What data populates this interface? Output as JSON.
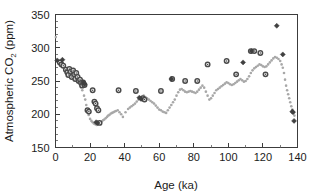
{
  "chart_data": {
    "type": "scatter",
    "title": "",
    "xlabel": "Age (ka)",
    "ylabel_main": "Atmospheric CO",
    "ylabel_sub": "2",
    "ylabel_unit": " (ppm)",
    "ylabel_full": "Atmospheric CO2 (ppm)",
    "xlim": [
      0,
      140
    ],
    "ylim": [
      150,
      350
    ],
    "xticks": [
      0,
      20,
      40,
      60,
      80,
      100,
      120,
      140
    ],
    "xtick_labels": [
      "0",
      "20",
      "40",
      "60",
      "80",
      "100",
      "120",
      "140"
    ],
    "x_minor_step": 10,
    "yticks": [
      150,
      200,
      250,
      300,
      350
    ],
    "ytick_labels": [
      "150",
      "200",
      "250",
      "300",
      "350"
    ],
    "y_minor_step": 10,
    "grid": false,
    "legend": "none",
    "frame": "box",
    "colors": {
      "dot_series": "#a8a8a8",
      "circle_series": "#4a4a4a",
      "diamond_series": "#404040",
      "axis": "#3c3c3c",
      "text": "#1c1c1c",
      "background": "#ffffff"
    },
    "series": [
      {
        "name": "ice-core-record-dots",
        "marker": "dot",
        "color": "#a8a8a8",
        "size": 2.6,
        "points": [
          [
            0.2,
            316
          ],
          [
            1.5,
            280
          ],
          [
            3.0,
            277
          ],
          [
            5.0,
            272
          ],
          [
            7.5,
            268
          ],
          [
            9.0,
            264
          ],
          [
            10.5,
            262
          ],
          [
            12.0,
            258
          ],
          [
            13.5,
            250
          ],
          [
            14.5,
            243
          ],
          [
            15.5,
            236
          ],
          [
            16.5,
            228
          ],
          [
            17.2,
            222
          ],
          [
            17.8,
            214
          ],
          [
            18.5,
            206
          ],
          [
            19.2,
            199
          ],
          [
            20.0,
            193
          ],
          [
            20.8,
            190
          ],
          [
            21.5,
            188
          ],
          [
            22.2,
            186
          ],
          [
            23.0,
            185
          ],
          [
            23.8,
            184
          ],
          [
            24.5,
            185
          ],
          [
            25.2,
            186
          ],
          [
            26.0,
            188
          ],
          [
            26.8,
            189
          ],
          [
            27.5,
            191
          ],
          [
            28.2,
            192
          ],
          [
            29.0,
            194
          ],
          [
            29.8,
            196
          ],
          [
            30.5,
            198
          ],
          [
            31.2,
            199
          ],
          [
            32.0,
            201
          ],
          [
            32.8,
            202
          ],
          [
            33.5,
            203
          ],
          [
            34.2,
            204
          ],
          [
            35.0,
            205
          ],
          [
            36.0,
            206
          ],
          [
            37.0,
            203
          ],
          [
            38.0,
            200
          ],
          [
            39.0,
            196
          ],
          [
            40.5,
            203
          ],
          [
            42.0,
            208
          ],
          [
            43.0,
            210
          ],
          [
            44.0,
            212
          ],
          [
            45.0,
            214
          ],
          [
            46.0,
            216
          ],
          [
            47.0,
            219
          ],
          [
            48.0,
            222
          ],
          [
            49.0,
            224
          ],
          [
            50.0,
            226
          ],
          [
            51.0,
            228
          ],
          [
            52.0,
            226
          ],
          [
            53.0,
            224
          ],
          [
            54.0,
            222
          ],
          [
            55.0,
            220
          ],
          [
            56.0,
            218
          ],
          [
            57.0,
            216
          ],
          [
            58.0,
            213
          ],
          [
            59.0,
            210
          ],
          [
            60.0,
            207
          ],
          [
            61.0,
            206
          ],
          [
            62.0,
            204
          ],
          [
            63.0,
            203
          ],
          [
            64.0,
            202
          ],
          [
            65.0,
            206
          ],
          [
            66.0,
            210
          ],
          [
            67.0,
            214
          ],
          [
            68.0,
            218
          ],
          [
            69.0,
            222
          ],
          [
            70.0,
            228
          ],
          [
            71.0,
            233
          ],
          [
            72.0,
            237
          ],
          [
            73.0,
            238
          ],
          [
            74.0,
            236
          ],
          [
            75.0,
            234
          ],
          [
            76.0,
            233
          ],
          [
            77.0,
            234
          ],
          [
            78.0,
            235
          ],
          [
            79.0,
            234
          ],
          [
            80.0,
            233
          ],
          [
            81.0,
            232
          ],
          [
            82.0,
            234
          ],
          [
            83.0,
            237
          ],
          [
            84.0,
            240
          ],
          [
            85.0,
            243
          ],
          [
            86.0,
            240
          ],
          [
            87.0,
            234
          ],
          [
            88.0,
            228
          ],
          [
            89.0,
            222
          ],
          [
            90.0,
            224
          ],
          [
            91.0,
            228
          ],
          [
            92.0,
            232
          ],
          [
            93.0,
            236
          ],
          [
            94.0,
            238
          ],
          [
            95.0,
            240
          ],
          [
            96.0,
            242
          ],
          [
            97.0,
            244
          ],
          [
            98.0,
            246
          ],
          [
            99.0,
            248
          ],
          [
            100.0,
            247
          ],
          [
            101.0,
            245
          ],
          [
            102.0,
            244
          ],
          [
            103.0,
            245
          ],
          [
            104.0,
            247
          ],
          [
            105.0,
            249
          ],
          [
            106.0,
            251
          ],
          [
            107.0,
            253
          ],
          [
            108.0,
            251
          ],
          [
            109.0,
            249
          ],
          [
            110.0,
            250
          ],
          [
            111.0,
            253
          ],
          [
            112.0,
            257
          ],
          [
            113.0,
            262
          ],
          [
            114.0,
            266
          ],
          [
            115.0,
            269
          ],
          [
            116.0,
            271
          ],
          [
            117.0,
            273
          ],
          [
            118.0,
            275
          ],
          [
            119.0,
            274
          ],
          [
            120.0,
            272
          ],
          [
            121.0,
            271
          ],
          [
            122.0,
            272
          ],
          [
            123.0,
            275
          ],
          [
            124.0,
            278
          ],
          [
            125.0,
            281
          ],
          [
            126.0,
            284
          ],
          [
            127.0,
            286
          ],
          [
            128.0,
            285
          ],
          [
            129.0,
            283
          ],
          [
            130.0,
            280
          ],
          [
            130.8,
            275
          ],
          [
            131.5,
            270
          ],
          [
            132.2,
            262
          ],
          [
            132.8,
            252
          ],
          [
            133.4,
            243
          ],
          [
            134.0,
            236
          ],
          [
            134.6,
            230
          ],
          [
            135.2,
            224
          ],
          [
            135.8,
            218
          ],
          [
            136.4,
            212
          ],
          [
            137.0,
            207
          ],
          [
            137.6,
            202
          ],
          [
            138.2,
            198
          ]
        ]
      },
      {
        "name": "vostok-ringed-circles",
        "marker": "ringed-circle",
        "color": "#4a4a4a",
        "size": 4.4,
        "points": [
          [
            2.5,
            278
          ],
          [
            3.5,
            275
          ],
          [
            4.5,
            273
          ],
          [
            6.0,
            267
          ],
          [
            6.8,
            263
          ],
          [
            7.4,
            259
          ],
          [
            8.0,
            268
          ],
          [
            8.8,
            264
          ],
          [
            9.4,
            256
          ],
          [
            10.2,
            266
          ],
          [
            10.8,
            260
          ],
          [
            11.4,
            253
          ],
          [
            12.0,
            262
          ],
          [
            12.8,
            256
          ],
          [
            13.4,
            250
          ],
          [
            14.2,
            252
          ],
          [
            14.8,
            247
          ],
          [
            15.4,
            243
          ],
          [
            16.0,
            248
          ],
          [
            16.8,
            244
          ],
          [
            18.5,
            206
          ],
          [
            19.3,
            204
          ],
          [
            21.5,
            236
          ],
          [
            22.5,
            219
          ],
          [
            23.2,
            216
          ],
          [
            24.0,
            209
          ],
          [
            24.8,
            206
          ],
          [
            25.5,
            187
          ],
          [
            36.5,
            236
          ],
          [
            46.5,
            235
          ],
          [
            50.5,
            224
          ],
          [
            51.5,
            222
          ],
          [
            61.0,
            235
          ],
          [
            67.5,
            253
          ],
          [
            75.0,
            250
          ],
          [
            82.0,
            250
          ],
          [
            88.0,
            275
          ],
          [
            99.0,
            280
          ],
          [
            104.5,
            260
          ],
          [
            113.0,
            295
          ],
          [
            115.0,
            295
          ],
          [
            118.5,
            292
          ],
          [
            121.5,
            260
          ]
        ]
      },
      {
        "name": "dome-c-diamonds",
        "marker": "diamond",
        "color": "#404040",
        "size": 5.0,
        "points": [
          [
            1.0,
            281
          ],
          [
            4.0,
            282
          ],
          [
            16.2,
            248
          ],
          [
            16.8,
            245
          ],
          [
            23.5,
            188
          ],
          [
            24.2,
            187
          ],
          [
            48.5,
            225
          ],
          [
            49.5,
            223
          ],
          [
            67.0,
            253
          ],
          [
            108.5,
            278
          ],
          [
            113.5,
            295
          ],
          [
            128.0,
            333
          ],
          [
            131.5,
            290
          ],
          [
            137.0,
            204
          ],
          [
            137.4,
            203
          ],
          [
            138.0,
            190
          ]
        ]
      }
    ]
  }
}
